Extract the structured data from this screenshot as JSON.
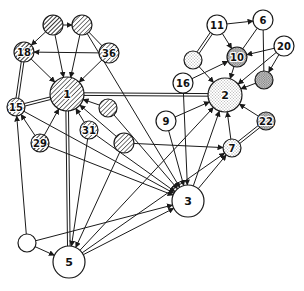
{
  "diagram": {
    "type": "directed-network",
    "colors": {
      "stroke": "#1a1a1a",
      "background": "#ffffff",
      "fill_white": "#ffffff"
    },
    "patterns": {
      "hatch_dark": "dense diagonal hatching",
      "hatch_light": "light diagonal hatching",
      "stipple_light": "light stippling",
      "stipple_dense": "dense stippling",
      "plain": "white"
    },
    "nodes": [
      {
        "id": "A",
        "label": "",
        "x": 53,
        "y": 25,
        "r": 10,
        "fill": "hatch_dark"
      },
      {
        "id": "B",
        "label": "",
        "x": 82,
        "y": 25,
        "r": 10,
        "fill": "hatch_light"
      },
      {
        "id": "18",
        "label": "18",
        "x": 24,
        "y": 52,
        "r": 10,
        "fill": "hatch_dark"
      },
      {
        "id": "36",
        "label": "36",
        "x": 109,
        "y": 53,
        "r": 10,
        "fill": "hatch_light"
      },
      {
        "id": "1",
        "label": "1",
        "x": 67,
        "y": 94,
        "r": 17,
        "fill": "hatch_light"
      },
      {
        "id": "15",
        "label": "15",
        "x": 16,
        "y": 107,
        "r": 9,
        "fill": "hatch_light"
      },
      {
        "id": "29",
        "label": "29",
        "x": 40,
        "y": 143,
        "r": 9,
        "fill": "hatch_dark"
      },
      {
        "id": "31",
        "label": "31",
        "x": 89,
        "y": 130,
        "r": 9,
        "fill": "hatch_light"
      },
      {
        "id": "C",
        "label": "",
        "x": 108,
        "y": 108,
        "r": 9,
        "fill": "hatch_light"
      },
      {
        "id": "D",
        "label": "",
        "x": 124,
        "y": 143,
        "r": 10,
        "fill": "hatch_light"
      },
      {
        "id": "11",
        "label": "11",
        "x": 217,
        "y": 25,
        "r": 10,
        "fill": "plain"
      },
      {
        "id": "6",
        "label": "6",
        "x": 263,
        "y": 20,
        "r": 10,
        "fill": "plain"
      },
      {
        "id": "10",
        "label": "10",
        "x": 237,
        "y": 57,
        "r": 10,
        "fill": "stipple_dense"
      },
      {
        "id": "20",
        "label": "20",
        "x": 284,
        "y": 46,
        "r": 10,
        "fill": "plain"
      },
      {
        "id": "E",
        "label": "",
        "x": 193,
        "y": 60,
        "r": 9,
        "fill": "stipple_light"
      },
      {
        "id": "F",
        "label": "",
        "x": 264,
        "y": 80,
        "r": 9,
        "fill": "stipple_dense"
      },
      {
        "id": "16",
        "label": "16",
        "x": 183,
        "y": 83,
        "r": 10,
        "fill": "plain"
      },
      {
        "id": "2",
        "label": "2",
        "x": 225,
        "y": 95,
        "r": 17,
        "fill": "stipple_light"
      },
      {
        "id": "9",
        "label": "9",
        "x": 166,
        "y": 121,
        "r": 10,
        "fill": "plain"
      },
      {
        "id": "22",
        "label": "22",
        "x": 266,
        "y": 121,
        "r": 9,
        "fill": "stipple_dense"
      },
      {
        "id": "7",
        "label": "7",
        "x": 232,
        "y": 148,
        "r": 9,
        "fill": "stipple_light"
      },
      {
        "id": "3",
        "label": "3",
        "x": 188,
        "y": 201,
        "r": 16,
        "fill": "plain"
      },
      {
        "id": "G",
        "label": "",
        "x": 27,
        "y": 243,
        "r": 9,
        "fill": "plain"
      },
      {
        "id": "5",
        "label": "5",
        "x": 69,
        "y": 262,
        "r": 16,
        "fill": "plain"
      }
    ],
    "edges": [
      {
        "from": "A",
        "to": "B",
        "arrow": true
      },
      {
        "from": "A",
        "to": "18",
        "arrow": true
      },
      {
        "from": "A",
        "to": "1",
        "arrow": true
      },
      {
        "from": "B",
        "to": "1",
        "arrow": true
      },
      {
        "from": "B",
        "to": "3",
        "arrow": true
      },
      {
        "from": "36",
        "to": "18",
        "arrow": true
      },
      {
        "from": "36",
        "to": "1",
        "arrow": true
      },
      {
        "from": "36",
        "to": "B",
        "arrow": false
      },
      {
        "from": "18",
        "to": "1",
        "arrow": true
      },
      {
        "from": "18",
        "to": "15",
        "double": true
      },
      {
        "from": "15",
        "to": "1",
        "double": true
      },
      {
        "from": "1",
        "to": "2",
        "double": true
      },
      {
        "from": "1",
        "to": "5",
        "double": true
      },
      {
        "from": "29",
        "to": "1",
        "arrow": true
      },
      {
        "from": "29",
        "to": "15",
        "arrow": true
      },
      {
        "from": "29",
        "to": "3",
        "arrow": true
      },
      {
        "from": "15",
        "to": "3",
        "arrow": true
      },
      {
        "from": "31",
        "to": "1",
        "arrow": true
      },
      {
        "from": "31",
        "to": "5",
        "arrow": true
      },
      {
        "from": "31",
        "to": "3",
        "arrow": true
      },
      {
        "from": "C",
        "to": "1",
        "arrow": true
      },
      {
        "from": "C",
        "to": "3",
        "arrow": true
      },
      {
        "from": "D",
        "to": "1",
        "arrow": true
      },
      {
        "from": "D",
        "to": "5",
        "arrow": true
      },
      {
        "from": "D",
        "to": "7",
        "arrow": true
      },
      {
        "from": "11",
        "to": "6",
        "arrow": true
      },
      {
        "from": "11",
        "to": "10",
        "arrow": true
      },
      {
        "from": "11",
        "to": "E",
        "double": true
      },
      {
        "from": "6",
        "to": "10",
        "arrow": false
      },
      {
        "from": "6",
        "to": "F",
        "arrow": false
      },
      {
        "from": "20",
        "to": "10",
        "arrow": true
      },
      {
        "from": "20",
        "to": "F",
        "arrow": true
      },
      {
        "from": "20",
        "to": "2",
        "arrow": true
      },
      {
        "from": "10",
        "to": "2",
        "arrow": true
      },
      {
        "from": "E",
        "to": "2",
        "arrow": true
      },
      {
        "from": "F",
        "to": "2",
        "arrow": true
      },
      {
        "from": "16",
        "to": "10",
        "arrow": true
      },
      {
        "from": "16",
        "to": "3",
        "arrow": true
      },
      {
        "from": "9",
        "to": "2",
        "arrow": true
      },
      {
        "from": "9",
        "to": "3",
        "arrow": true
      },
      {
        "from": "22",
        "to": "2",
        "arrow": true
      },
      {
        "from": "22",
        "to": "7",
        "double": true
      },
      {
        "from": "7",
        "to": "2",
        "arrow": true
      },
      {
        "from": "3",
        "to": "2",
        "arrow": true
      },
      {
        "from": "3",
        "to": "7",
        "arrow": true
      },
      {
        "from": "5",
        "to": "2",
        "arrow": true
      },
      {
        "from": "5",
        "to": "3",
        "arrow": true
      },
      {
        "from": "5",
        "to": "7",
        "arrow": true
      },
      {
        "from": "G",
        "to": "15",
        "arrow": true
      },
      {
        "from": "G",
        "to": "5",
        "arrow": true
      },
      {
        "from": "G",
        "to": "3",
        "arrow": true
      }
    ]
  }
}
